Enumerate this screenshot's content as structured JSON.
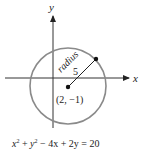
{
  "diagram": {
    "axes": {
      "x_label": "x",
      "y_label": "y"
    },
    "circle": {
      "center_label": "(2, −1)",
      "center": [
        2,
        -1
      ],
      "radius_label": "radius",
      "radius_value": "5",
      "stroke_color": "#8a8a8a"
    },
    "equation": {
      "x_term": "x",
      "y_term": "y",
      "exp": "2",
      "rest": " − 4x + 2y = 20",
      "full": "x² + y² − 4x + 2y = 20"
    },
    "colors": {
      "axis": "#333333",
      "point": "#111111",
      "text": "#222222"
    }
  }
}
